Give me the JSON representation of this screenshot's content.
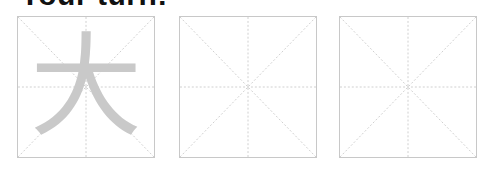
{
  "title": "Your turn:",
  "grid_color": "#cfcfcf",
  "trace_color": "#c9c9c9",
  "boxes": [
    {
      "character": "大"
    },
    {
      "character": ""
    },
    {
      "character": ""
    }
  ]
}
